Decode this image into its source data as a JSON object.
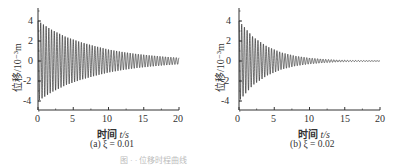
{
  "chart_data": [
    {
      "type": "line",
      "title": "",
      "caption": "(a) ξ = 0.01",
      "xlabel": "时间 t/s",
      "ylabel": "位移/10⁻³m",
      "xlim": [
        0,
        20
      ],
      "ylim": [
        -5,
        5
      ],
      "xticks": [
        0,
        5,
        10,
        15,
        20
      ],
      "yticks": [
        -4,
        -2,
        0,
        2,
        4
      ],
      "grid": false,
      "series": [
        {
          "name": "displacement",
          "description": "damped free vibration, envelope decays from ~4 to ~0.3 over 20 s",
          "envelope": {
            "t": [
              0,
              2,
              4,
              6,
              8,
              10,
              12,
              14,
              16,
              18,
              20
            ],
            "amp": [
              4.0,
              3.1,
              2.4,
              1.9,
              1.5,
              1.15,
              0.9,
              0.7,
              0.55,
              0.42,
              0.32
            ]
          },
          "damping_ratio": 0.01
        }
      ]
    },
    {
      "type": "line",
      "title": "",
      "caption": "(b) ξ = 0.02",
      "xlabel": "时间 t/s",
      "ylabel": "位移/10⁻³m",
      "xlim": [
        0,
        20
      ],
      "ylim": [
        -5,
        5
      ],
      "xticks": [
        0,
        5,
        10,
        15,
        20
      ],
      "yticks": [
        -4,
        -2,
        0,
        2,
        4
      ],
      "grid": false,
      "series": [
        {
          "name": "displacement",
          "description": "damped free vibration, envelope decays from ~4 to ~0 by ~10 s",
          "envelope": {
            "t": [
              0,
              2,
              4,
              6,
              8,
              10,
              12,
              14,
              16,
              18,
              20
            ],
            "amp": [
              4.0,
              2.4,
              1.45,
              0.85,
              0.5,
              0.3,
              0.18,
              0.1,
              0.06,
              0.04,
              0.02
            ]
          },
          "damping_ratio": 0.02
        }
      ]
    }
  ],
  "panels": [
    {
      "caption": "(a) ξ = 0.01",
      "xlabel_cn": "时间",
      "xlabel_var": " t/s",
      "ylabel": "位移/10⁻³m",
      "xticks": [
        "0",
        "5",
        "10",
        "15",
        "20"
      ],
      "yticks": [
        "4",
        "2",
        "0",
        "-2",
        "-4"
      ]
    },
    {
      "caption": "(b) ξ = 0.02",
      "xlabel_cn": "时间",
      "xlabel_var": " t/s",
      "ylabel": "位移/10⁻³m",
      "xticks": [
        "0",
        "5",
        "10",
        "15",
        "20"
      ],
      "yticks": [
        "4",
        "2",
        "0",
        "-2",
        "-4"
      ]
    }
  ],
  "figure_caption": "图 · · 位移时程曲线"
}
